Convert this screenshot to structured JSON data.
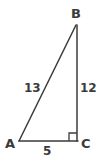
{
  "figure": {
    "type": "right-triangle-diagram",
    "background_color": "#ffffff",
    "stroke_color": "#3b3b3b",
    "text_color": "#3b3b3b",
    "stroke_width": 1.5,
    "width": 99,
    "height": 161,
    "vertices": [
      {
        "name": "A",
        "label": "A",
        "x": 19,
        "y": 141
      },
      {
        "name": "B",
        "label": "B",
        "x": 76,
        "y": 25
      },
      {
        "name": "C",
        "label": "C",
        "x": 77,
        "y": 141
      }
    ],
    "sides": [
      {
        "name": "hypotenuse-AB",
        "label": "13",
        "from": "A",
        "to": "B"
      },
      {
        "name": "leg-BC",
        "label": "12",
        "from": "B",
        "to": "C"
      },
      {
        "name": "leg-AC",
        "label": "5",
        "from": "A",
        "to": "C"
      }
    ],
    "right_angle": {
      "at_vertex": "C",
      "marker": "square",
      "size": 8
    }
  }
}
